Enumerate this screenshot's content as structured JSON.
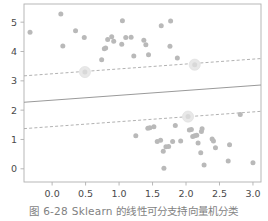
{
  "figure": {
    "caption_number": "图 6-28",
    "caption_text": "Sklearn 的线性可分支持向量机分类"
  },
  "chart_data": {
    "type": "scatter",
    "title": "",
    "xlabel": "",
    "ylabel": "",
    "xlim": [
      -0.42,
      3.12
    ],
    "ylim": [
      -0.45,
      5.62
    ],
    "grid": false,
    "legend": null,
    "xticks": [
      0.0,
      0.5,
      1.0,
      1.5,
      2.0,
      2.5,
      3.0
    ],
    "xticklabels": [
      "0.0",
      "0.5",
      "1.0",
      "1.5",
      "2.0",
      "2.5",
      "3.0"
    ],
    "yticks": [
      0,
      1,
      2,
      3,
      4,
      5
    ],
    "yticklabels": [
      "0",
      "1",
      "2",
      "3",
      "4",
      "5"
    ],
    "point_color": "#b9b9b9",
    "support_vector_color": "#e8e8e8",
    "decision_line_color": "#9a9a9a",
    "margin_line_color": "#a8a8a8",
    "axis_color": "#b0b0b0",
    "series": [
      {
        "name": "class-positive-upper",
        "marker": "o",
        "points": [
          [
            -0.33,
            4.66
          ],
          [
            0.13,
            5.28
          ],
          [
            0.16,
            4.19
          ],
          [
            0.35,
            4.71
          ],
          [
            0.48,
            4.48
          ],
          [
            0.49,
            3.3
          ],
          [
            0.74,
            3.72
          ],
          [
            0.78,
            4.09
          ],
          [
            0.8,
            4.12
          ],
          [
            0.83,
            4.41
          ],
          [
            0.89,
            4.5
          ],
          [
            0.92,
            4.35
          ],
          [
            1.05,
            5.05
          ],
          [
            1.04,
            4.25
          ],
          [
            1.1,
            4.48
          ],
          [
            1.18,
            4.49
          ],
          [
            1.22,
            3.85
          ],
          [
            1.37,
            4.38
          ],
          [
            1.4,
            4.23
          ],
          [
            1.44,
            3.89
          ],
          [
            1.63,
            4.88
          ],
          [
            1.77,
            5.04
          ],
          [
            1.76,
            4.18
          ],
          [
            1.87,
            3.78
          ],
          [
            2.13,
            3.55
          ]
        ]
      },
      {
        "name": "class-negative-lower",
        "marker": "o",
        "points": [
          [
            1.25,
            1.13
          ],
          [
            1.43,
            1.38
          ],
          [
            1.46,
            1.4
          ],
          [
            1.52,
            1.43
          ],
          [
            1.57,
            0.93
          ],
          [
            1.62,
            0.97
          ],
          [
            1.66,
            0.6
          ],
          [
            1.67,
            0.02
          ],
          [
            1.7,
            0.75
          ],
          [
            1.74,
            0.76
          ],
          [
            1.8,
            0.93
          ],
          [
            1.84,
            1.48
          ],
          [
            1.92,
            0.95
          ],
          [
            2.03,
            1.78
          ],
          [
            2.05,
            1.32
          ],
          [
            2.08,
            1.34
          ],
          [
            2.1,
            1.1
          ],
          [
            2.13,
            1.13
          ],
          [
            2.16,
            1.14
          ],
          [
            2.18,
            0.88
          ],
          [
            2.23,
            1.27
          ],
          [
            2.22,
            0.55
          ],
          [
            2.24,
            1.37
          ],
          [
            2.27,
            0.13
          ],
          [
            2.39,
            1.02
          ],
          [
            2.41,
            0.95
          ],
          [
            2.44,
            0.72
          ],
          [
            2.63,
            0.27
          ],
          [
            2.65,
            0.82
          ],
          [
            2.81,
            1.85
          ],
          [
            3.0,
            0.21
          ]
        ]
      }
    ],
    "support_vectors": [
      [
        0.49,
        3.3
      ],
      [
        2.13,
        3.55
      ],
      [
        2.03,
        1.78
      ]
    ],
    "lines": [
      {
        "name": "decision-boundary",
        "style": "solid",
        "x": [
          -0.42,
          3.12
        ],
        "y": [
          2.27,
          2.86
        ]
      },
      {
        "name": "margin-upper",
        "style": "dashed",
        "x": [
          -0.42,
          3.12
        ],
        "y": [
          3.17,
          3.76
        ]
      },
      {
        "name": "margin-lower",
        "style": "dashed",
        "x": [
          -0.42,
          3.12
        ],
        "y": [
          1.37,
          1.96
        ]
      }
    ]
  }
}
